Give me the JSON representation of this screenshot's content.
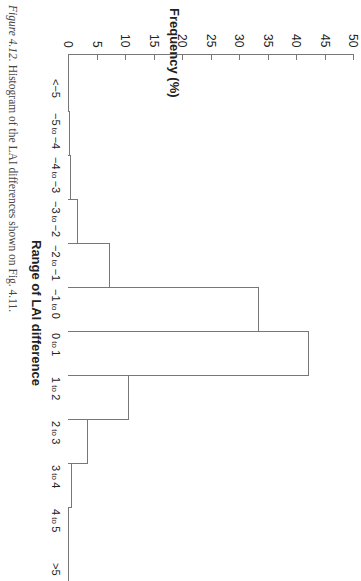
{
  "caption": {
    "figure": "Figure 4.12.",
    "text": " Histogram of the LAI differences shown on Fig. 4.11."
  },
  "chart_data": {
    "type": "bar",
    "orientation": "rotated 90° clockwise (printed sideways)",
    "title": "",
    "xlabel": "Range of LAI difference",
    "ylabel": "Frequency (%)",
    "ylim": [
      0,
      50
    ],
    "yticks": [
      0,
      5,
      10,
      15,
      20,
      25,
      30,
      35,
      40,
      45,
      50
    ],
    "grid": false,
    "legend": null,
    "categories": [
      "<−5",
      "−5 to −4",
      "−4 to −3",
      "−3 to −2",
      "−2 to −1",
      "−1 to 0",
      "0 to 1",
      "1 to 2",
      "2 to 3",
      "3 to 4",
      "4 to 5",
      ">5"
    ],
    "values": [
      0.0,
      0.3,
      0.5,
      1.7,
      7.4,
      33.5,
      42.3,
      10.7,
      3.5,
      0.7,
      0.0,
      0.0
    ]
  },
  "category_parts": [
    {
      "a": "<−5",
      "to": "",
      "b": ""
    },
    {
      "a": "−5",
      "to": "to",
      "b": "−4"
    },
    {
      "a": "−4",
      "to": "to",
      "b": "−3"
    },
    {
      "a": "−3",
      "to": "to",
      "b": "−2"
    },
    {
      "a": "−2",
      "to": "to",
      "b": "−1"
    },
    {
      "a": "−1",
      "to": "to",
      "b": "0"
    },
    {
      "a": "0",
      "to": "to",
      "b": "1"
    },
    {
      "a": "1",
      "to": "to",
      "b": "2"
    },
    {
      "a": "2",
      "to": "to",
      "b": "3"
    },
    {
      "a": "3",
      "to": "to",
      "b": "4"
    },
    {
      "a": "4",
      "to": "to",
      "b": "5"
    },
    {
      "a": ">5",
      "to": "",
      "b": ""
    }
  ]
}
